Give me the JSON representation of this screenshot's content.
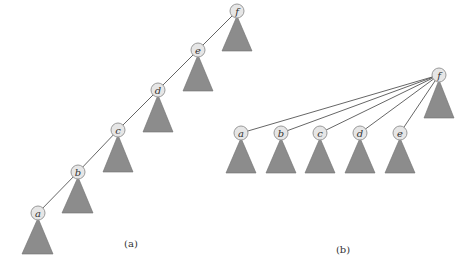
{
  "colors": {
    "background": "#ffffff",
    "node_fill": "#e6e6e6",
    "node_stroke": "#9a9a9a",
    "subtree_fill": "#8c8c8c",
    "edge": "#555555"
  },
  "panel_a": {
    "caption": "(a)",
    "description": "Path (chain) of nodes a-b-c-d-e-f before path compression; each node has a subtree triangle",
    "nodes": [
      {
        "id": "f",
        "label": "f",
        "x": 237,
        "y": 11
      },
      {
        "id": "e",
        "label": "e",
        "x": 198,
        "y": 50
      },
      {
        "id": "d",
        "label": "d",
        "x": 158,
        "y": 90
      },
      {
        "id": "c",
        "label": "c",
        "x": 118,
        "y": 130
      },
      {
        "id": "b",
        "label": "b",
        "x": 78,
        "y": 172
      },
      {
        "id": "a",
        "label": "a",
        "x": 38,
        "y": 213
      }
    ],
    "edges": [
      [
        "f",
        "e"
      ],
      [
        "e",
        "d"
      ],
      [
        "d",
        "c"
      ],
      [
        "c",
        "b"
      ],
      [
        "b",
        "a"
      ]
    ]
  },
  "panel_b": {
    "caption": "(b)",
    "description": "After path compression: nodes a-e all point directly to root f",
    "nodes": [
      {
        "id": "f",
        "label": "f",
        "x": 439,
        "y": 75
      },
      {
        "id": "a",
        "label": "a",
        "x": 241,
        "y": 133
      },
      {
        "id": "b",
        "label": "b",
        "x": 281,
        "y": 133
      },
      {
        "id": "c",
        "label": "c",
        "x": 320,
        "y": 133
      },
      {
        "id": "d",
        "label": "d",
        "x": 360,
        "y": 133
      },
      {
        "id": "e",
        "label": "e",
        "x": 400,
        "y": 133
      }
    ],
    "edges": [
      [
        "f",
        "a"
      ],
      [
        "f",
        "b"
      ],
      [
        "f",
        "c"
      ],
      [
        "f",
        "d"
      ],
      [
        "f",
        "e"
      ]
    ]
  }
}
